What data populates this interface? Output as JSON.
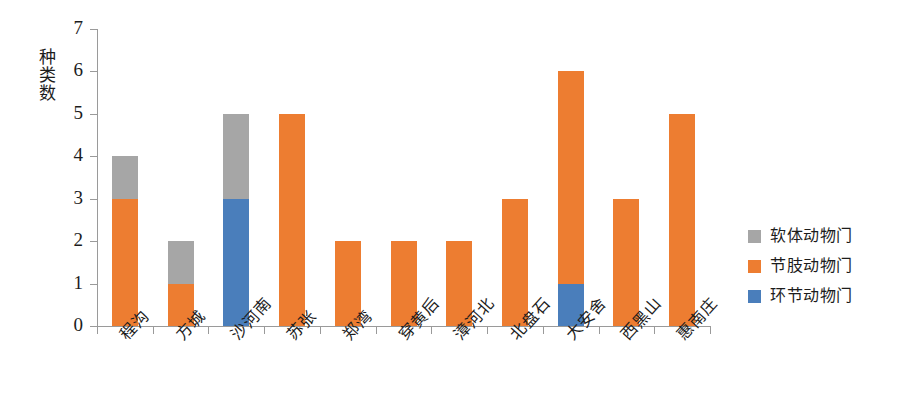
{
  "chart_data": {
    "type": "bar",
    "stacked": true,
    "title": "",
    "xlabel": "",
    "ylabel": "种类数",
    "ylim": [
      0,
      7
    ],
    "ytick_labels": [
      "0",
      "1",
      "2",
      "3",
      "4",
      "5",
      "6",
      "7"
    ],
    "grid": false,
    "legend_position": "right",
    "categories": [
      "程沟",
      "方城",
      "沙河南",
      "苏张",
      "郑湾",
      "穿黄后",
      "漳河北",
      "北盘石",
      "大安舍",
      "西黑山",
      "惠南庄"
    ],
    "series": [
      {
        "name": "环节动物门",
        "color": "#4a7ebb",
        "values": [
          0,
          0,
          3,
          0,
          0,
          0,
          0,
          0,
          1,
          0,
          0
        ]
      },
      {
        "name": "节肢动物门",
        "color": "#ed7d31",
        "values": [
          3,
          1,
          0,
          5,
          2,
          2,
          2,
          3,
          5,
          3,
          5
        ]
      },
      {
        "name": "软体动物门",
        "color": "#a6a6a6",
        "values": [
          1,
          1,
          2,
          0,
          0,
          0,
          0,
          0,
          0,
          0,
          0
        ]
      }
    ],
    "totals": [
      4,
      2,
      5,
      5,
      2,
      2,
      2,
      3,
      6,
      3,
      5
    ],
    "stack_order_bottom_to_top": [
      "环节动物门",
      "节肢动物门",
      "软体动物门"
    ]
  },
  "legend": {
    "items": [
      {
        "label": "软体动物门",
        "color": "#a6a6a6"
      },
      {
        "label": "节肢动物门",
        "color": "#ed7d31"
      },
      {
        "label": "环节动物门",
        "color": "#4a7ebb"
      }
    ]
  },
  "axis": {
    "y_title": "种类数"
  },
  "colors": {
    "axis": "#9a9a9a",
    "text": "#1c1c1c",
    "background": "#ffffff",
    "mollusca_gray": "#a6a6a6",
    "arthropoda_orange": "#ed7d31",
    "annelida_blue": "#4a7ebb"
  }
}
